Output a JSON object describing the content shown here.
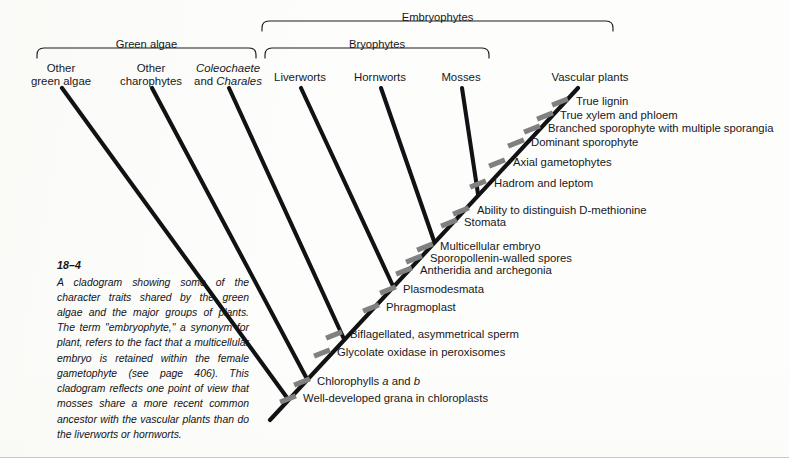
{
  "figure": {
    "number": "18–4",
    "caption": "A cladogram showing some of the character traits shared by the green algae and the major groups of plants. The term \"embryophyte,\" a synonym for plant, refers to the fact that a multicellular embryo is retained within the female gametophyte (see page 406). This cladogram reflects one point of view that mosses share a more recent common ancestor with the vascular plants than do the liverworts or hornworts."
  },
  "groups": [
    {
      "id": "green-algae",
      "label": "Green algae",
      "x1": 37,
      "x2": 256,
      "label_y": 38,
      "bracket_y": 48
    },
    {
      "id": "embryophytes",
      "label": "Embryophytes",
      "x1": 262,
      "x2": 613,
      "label_y": 11,
      "bracket_y": 21
    },
    {
      "id": "bryophytes",
      "label": "Bryophytes",
      "x1": 265,
      "x2": 489,
      "label_y": 38,
      "bracket_y": 48
    }
  ],
  "taxa": [
    {
      "id": "other-green-algae",
      "line1": "Other",
      "line2": "green algae",
      "x": 61,
      "y": 62,
      "tip_x": 62,
      "tip_y": 88
    },
    {
      "id": "other-charophytes",
      "line1": "Other",
      "line2": "charophytes",
      "x": 151,
      "y": 62,
      "tip_x": 152,
      "tip_y": 88
    },
    {
      "id": "coleochaete-charales",
      "line1": "Coleochaete",
      "line2": "and Charales",
      "x": 228,
      "y": 62,
      "tip_x": 229,
      "tip_y": 88,
      "italic1": true,
      "italic_word2": "Charales"
    },
    {
      "id": "liverworts",
      "line1": "Liverworts",
      "line2": "",
      "x": 300,
      "y": 71,
      "tip_x": 301,
      "tip_y": 88
    },
    {
      "id": "hornworts",
      "line1": "Hornworts",
      "line2": "",
      "x": 380,
      "y": 71,
      "tip_x": 381,
      "tip_y": 88
    },
    {
      "id": "mosses",
      "line1": "Mosses",
      "line2": "",
      "x": 461,
      "y": 71,
      "tip_x": 462,
      "tip_y": 88
    },
    {
      "id": "vascular-plants",
      "line1": "Vascular plants",
      "line2": "",
      "x": 590,
      "y": 71,
      "tip_x": 578,
      "tip_y": 88
    }
  ],
  "traits": [
    {
      "id": "true-lignin",
      "label": "True lignin",
      "text_x": 576,
      "text_y": 95,
      "mark_x": 560,
      "mark_y": 102
    },
    {
      "id": "true-xylem-and-phloem",
      "label": "True xylem and phloem",
      "text_x": 560,
      "text_y": 109,
      "mark_x": 545,
      "mark_y": 116
    },
    {
      "id": "branched-sporophyte",
      "label": "Branched sporophyte with multiple sporangia",
      "text_x": 548,
      "text_y": 122,
      "mark_x": 532,
      "mark_y": 129
    },
    {
      "id": "dominant-sporophyte",
      "label": "Dominant sporophyte",
      "text_x": 531,
      "text_y": 136,
      "mark_x": 516,
      "mark_y": 143
    },
    {
      "id": "axial-gametophytes",
      "label": "Axial gametophytes",
      "text_x": 513,
      "text_y": 156,
      "mark_x": 497,
      "mark_y": 163
    },
    {
      "id": "hadrom-and-leptom",
      "label": "Hadrom and leptom",
      "text_x": 494,
      "text_y": 177,
      "mark_x": 478,
      "mark_y": 184
    },
    {
      "id": "ability-d-methionine",
      "label": "Ability to distinguish D-methionine",
      "text_x": 477,
      "text_y": 204,
      "mark_x": 461,
      "mark_y": 211
    },
    {
      "id": "stomata",
      "label": "Stomata",
      "text_x": 464,
      "text_y": 216,
      "mark_x": 449,
      "mark_y": 223
    },
    {
      "id": "multicellular-embryo",
      "label": "Multicellular embryo",
      "text_x": 440,
      "text_y": 240,
      "mark_x": 425,
      "mark_y": 247
    },
    {
      "id": "sporopollenin-spores",
      "label": "Sporopollenin-walled spores",
      "text_x": 430,
      "text_y": 252,
      "mark_x": 414,
      "mark_y": 259
    },
    {
      "id": "antheridia-archegonia",
      "label": "Antheridia and archegonia",
      "text_x": 420,
      "text_y": 264,
      "mark_x": 404,
      "mark_y": 271
    },
    {
      "id": "plasmodesmata",
      "label": "Plasmodesmata",
      "text_x": 403,
      "text_y": 283,
      "mark_x": 388,
      "mark_y": 290
    },
    {
      "id": "phragmoplast",
      "label": "Phragmoplast",
      "text_x": 386,
      "text_y": 301,
      "mark_x": 371,
      "mark_y": 308
    },
    {
      "id": "biflagellated-sperm",
      "label": "Biflagellated, asymmetrical sperm",
      "text_x": 350,
      "text_y": 328,
      "mark_x": 334,
      "mark_y": 335
    },
    {
      "id": "glycolate-oxidase",
      "label": "Glycolate oxidase in peroxisomes",
      "text_x": 337,
      "text_y": 346,
      "mark_x": 322,
      "mark_y": 353
    },
    {
      "id": "chlorophylls-a-and-b",
      "label": "Chlorophylls a and b",
      "text_x": 317,
      "text_y": 375,
      "mark_x": 302,
      "mark_y": 382,
      "italic_letters": [
        "a",
        "b"
      ]
    },
    {
      "id": "grana-chloroplasts",
      "label": "Well-developed grana in chloroplasts",
      "text_x": 303,
      "text_y": 392,
      "mark_x": 288,
      "mark_y": 399
    }
  ],
  "chart_data": {
    "type": "diagram",
    "diagram_kind": "cladogram",
    "root": {
      "x": 270,
      "y": 420
    },
    "backbone": [
      {
        "x": 270,
        "y": 420
      },
      {
        "x": 578,
        "y": 88
      }
    ],
    "nodes": [
      {
        "id": "node-grana",
        "x": 288,
        "y": 399,
        "branch_to": {
          "x": 62,
          "y": 88
        },
        "taxon": "other-green-algae"
      },
      {
        "id": "node-chlorophylls",
        "x": 307,
        "y": 379,
        "branch_to": {
          "x": 152,
          "y": 88
        },
        "taxon": "other-charophytes"
      },
      {
        "id": "node-glycolate",
        "x": 344,
        "y": 339,
        "branch_to": {
          "x": 229,
          "y": 88
        },
        "taxon": "coleochaete-charales"
      },
      {
        "id": "node-plasmodesmata",
        "x": 393,
        "y": 286,
        "branch_to": {
          "x": 301,
          "y": 88
        },
        "taxon": "liverworts"
      },
      {
        "id": "node-embryo",
        "x": 434,
        "y": 241,
        "branch_to": {
          "x": 381,
          "y": 88
        },
        "taxon": "hornworts"
      },
      {
        "id": "node-stomata",
        "x": 478,
        "y": 194,
        "branch_to": {
          "x": 462,
          "y": 88
        },
        "taxon": "mosses"
      }
    ],
    "tip_count": 7,
    "trait_count": 17,
    "colors": {
      "branch": "#111214",
      "hash_mark": "#808080",
      "text": "#17181a",
      "background": "#fdfdfc"
    }
  }
}
